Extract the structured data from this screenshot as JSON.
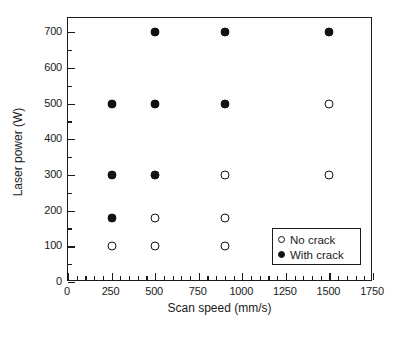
{
  "chart_data": {
    "type": "scatter",
    "title": "",
    "xlabel": "Scan speed (mm/s)",
    "ylabel": "Laser power (W)",
    "xlim": [
      0,
      1750
    ],
    "ylim": [
      0,
      740
    ],
    "grid": false,
    "legend_position": "bottom-right",
    "x_ticks": [
      0,
      250,
      500,
      750,
      1000,
      1250,
      1500,
      1750
    ],
    "x_tick_labels": [
      "0",
      "250",
      "500",
      "750",
      "1000",
      "1250",
      "1500",
      "1750"
    ],
    "x_minor_tick_step": 50,
    "y_ticks": [
      0,
      100,
      200,
      300,
      400,
      500,
      600,
      700
    ],
    "y_tick_labels": [
      "0",
      "100",
      "200",
      "300",
      "400",
      "500",
      "600",
      "700"
    ],
    "y_minor_tick_step": 50,
    "series": [
      {
        "name": "No crack",
        "marker": "open-circle",
        "color": "#111111",
        "points": [
          {
            "x": 250,
            "y": 100
          },
          {
            "x": 500,
            "y": 100
          },
          {
            "x": 500,
            "y": 180
          },
          {
            "x": 900,
            "y": 100
          },
          {
            "x": 900,
            "y": 180
          },
          {
            "x": 900,
            "y": 300
          },
          {
            "x": 1500,
            "y": 300
          },
          {
            "x": 1500,
            "y": 500
          }
        ]
      },
      {
        "name": "With crack",
        "marker": "filled-circle",
        "color": "#111111",
        "points": [
          {
            "x": 250,
            "y": 180
          },
          {
            "x": 250,
            "y": 300
          },
          {
            "x": 250,
            "y": 500
          },
          {
            "x": 500,
            "y": 300
          },
          {
            "x": 500,
            "y": 500
          },
          {
            "x": 500,
            "y": 700
          },
          {
            "x": 900,
            "y": 500
          },
          {
            "x": 900,
            "y": 700
          },
          {
            "x": 1500,
            "y": 700
          }
        ]
      }
    ]
  },
  "legend": {
    "entries": [
      {
        "label": "No crack",
        "marker": "open-circle"
      },
      {
        "label": "With crack",
        "marker": "filled-circle"
      }
    ]
  },
  "caption": {
    "text": ""
  }
}
